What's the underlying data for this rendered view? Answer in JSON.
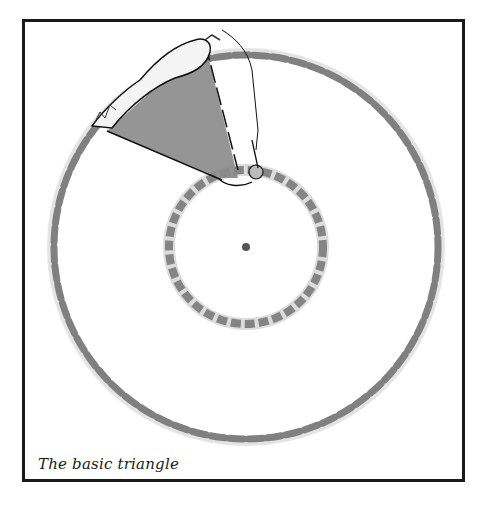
{
  "figure": {
    "caption": "The basic triangle",
    "outer_ring": {
      "cx": 246,
      "cy": 247,
      "r": 192,
      "color": "#6e6e6e"
    },
    "inner_ring": {
      "cx": 246,
      "cy": 247,
      "r": 77,
      "color": "#6e6e6e"
    },
    "center_dot": {
      "cx": 246,
      "cy": 247,
      "r": 4,
      "color": "#555555"
    },
    "triangle": {
      "fill": "#8a8a8a",
      "stroke": "#111111"
    },
    "frame_color": "#1a1a1a"
  }
}
